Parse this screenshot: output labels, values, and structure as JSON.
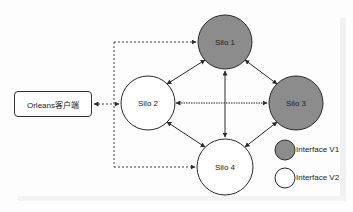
{
  "diagram": {
    "client": {
      "label": "Orleans客户端"
    },
    "silos": [
      {
        "id": "silo1",
        "label": "Silo 1",
        "interface": "V1",
        "cx": 225,
        "cy": 42
      },
      {
        "id": "silo2",
        "label": "Silo 2",
        "interface": "V2",
        "cx": 148,
        "cy": 103
      },
      {
        "id": "silo3",
        "label": "Silo 3",
        "interface": "V1",
        "cx": 296,
        "cy": 103
      },
      {
        "id": "silo4",
        "label": "Silo 4",
        "interface": "V2",
        "cx": 225,
        "cy": 167
      }
    ],
    "edges": [
      {
        "from": "silo1",
        "to": "silo2",
        "style": "solid",
        "bidirectional": true
      },
      {
        "from": "silo1",
        "to": "silo3",
        "style": "solid",
        "bidirectional": true
      },
      {
        "from": "silo1",
        "to": "silo4",
        "style": "solid",
        "bidirectional": true
      },
      {
        "from": "silo2",
        "to": "silo3",
        "style": "dotted",
        "bidirectional": true
      },
      {
        "from": "silo2",
        "to": "silo4",
        "style": "solid",
        "bidirectional": true
      },
      {
        "from": "silo3",
        "to": "silo4",
        "style": "solid",
        "bidirectional": true
      },
      {
        "from": "client",
        "to": "silo1",
        "style": "dashed",
        "bidirectional": false
      },
      {
        "from": "client",
        "to": "silo2",
        "style": "dashed",
        "bidirectional": true
      },
      {
        "from": "client",
        "to": "silo4",
        "style": "dashed",
        "bidirectional": false
      }
    ],
    "legend": [
      {
        "label": "Interface V1",
        "fill": "#8c8c8c"
      },
      {
        "label": "Interface V2",
        "fill": "#ffffff"
      }
    ],
    "colors": {
      "v1_fill": "#8c8c8c",
      "v2_fill": "#ffffff",
      "stroke": "#2b2b2b"
    }
  }
}
